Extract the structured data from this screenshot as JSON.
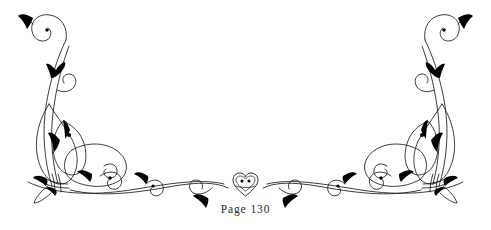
{
  "document": {
    "background_color": "#ffffff",
    "ink_color": "#1a1a1a",
    "page_label": "Page 130"
  },
  "ornament": {
    "kind": "calligraphic-floral-flourish",
    "description": "Symmetric scrollwork headpiece with tall curling stems, teardrop petal loops, leaf accents and a central heart medallion",
    "symmetry": "mirrored-left-right",
    "stroke_color": "#1a1a1a",
    "fill_color": "#000000",
    "center_x": 245.5,
    "parts": [
      "left-upper-curl",
      "left-stem",
      "left-petal-loops",
      "left-base-knot",
      "left-swag",
      "center-heart-medallion",
      "right-swag",
      "right-base-knot",
      "right-petal-loops",
      "right-stem",
      "right-upper-curl"
    ]
  }
}
